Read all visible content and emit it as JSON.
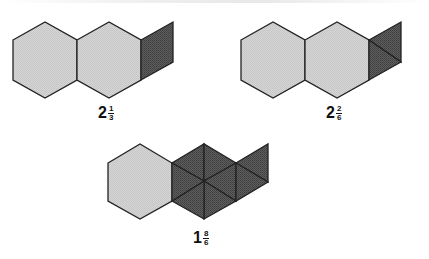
{
  "figures": [
    {
      "id": "figure-a",
      "description": "two light hexagons plus one dark rhombus (two thirds... shaded one third of a hexagon)",
      "pieces": [
        "hexagon",
        "hexagon",
        "rhombus"
      ],
      "label": {
        "whole": "2",
        "numerator": "1",
        "denominator": "3"
      }
    },
    {
      "id": "figure-b",
      "description": "two light hexagons plus two dark triangles",
      "pieces": [
        "hexagon",
        "hexagon",
        "triangle",
        "triangle"
      ],
      "label": {
        "whole": "2",
        "numerator": "2",
        "denominator": "6"
      }
    },
    {
      "id": "figure-c",
      "description": "one light hexagon, one dark hexagon split into six triangles, plus two dark triangles",
      "pieces": [
        "hexagon",
        "triangle",
        "triangle",
        "triangle",
        "triangle",
        "triangle",
        "triangle",
        "triangle",
        "triangle"
      ],
      "label": {
        "whole": "1",
        "numerator": "8",
        "denominator": "6"
      }
    }
  ],
  "colors": {
    "light_fill": "#d2d2d2",
    "dark_fill": "#5a5a5a",
    "stroke": "#222222"
  }
}
